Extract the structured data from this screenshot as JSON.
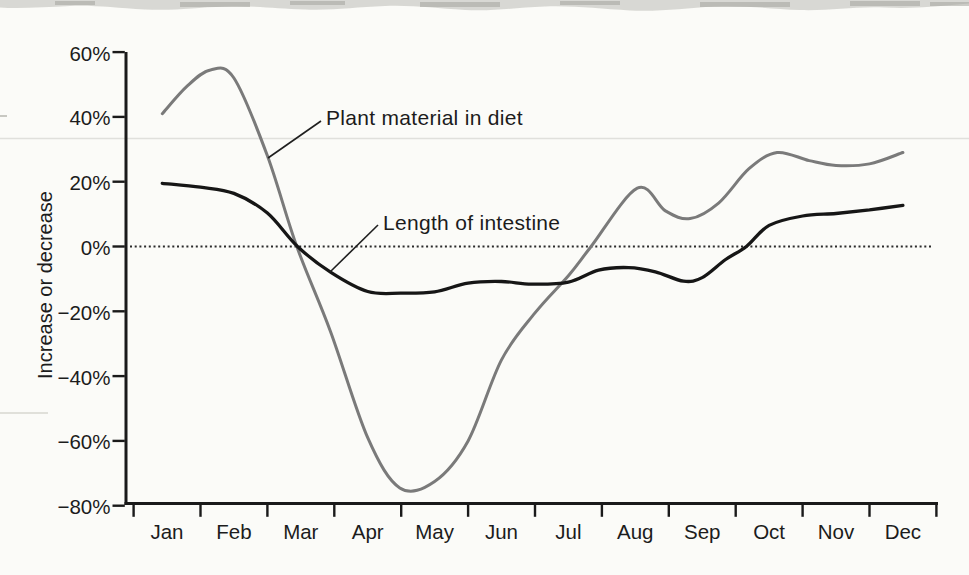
{
  "figure": {
    "paper_color": "#fbfbf8",
    "y_axis_title": "Increase or decrease",
    "annotations": [
      {
        "id": "plant",
        "text": "Plant material in diet"
      },
      {
        "id": "intestine",
        "text": "Length of intestine"
      }
    ]
  },
  "chart_data": {
    "type": "line",
    "title": "",
    "xlabel": "",
    "ylabel": "Increase or decrease",
    "categories": [
      "Jan",
      "Feb",
      "Mar",
      "Apr",
      "May",
      "Jun",
      "Jul",
      "Aug",
      "Sep",
      "Oct",
      "Nov",
      "Dec"
    ],
    "ylim": [
      -80,
      60
    ],
    "ytick_values": [
      60,
      40,
      20,
      0,
      -20,
      -40,
      -60,
      -80
    ],
    "ytick_labels": [
      "60%",
      "40%",
      "20%",
      "0%",
      "−20%",
      "−40%",
      "−60%",
      "−80%"
    ],
    "grid": false,
    "zero_line": "dotted horizontal line at 0%",
    "legend_position": "inline annotations with leader lines",
    "axis_color": "#1a1a1a",
    "series": [
      {
        "id": "plant-material",
        "name": "Plant material in diet",
        "color": "#7a7a7a",
        "line_width": 3,
        "values": [
          41,
          52,
          -2,
          -59,
          -72,
          -35,
          -9,
          18,
          10,
          29,
          25,
          29
        ],
        "max_percent": 54.5,
        "min_percent": -74.5,
        "path_points": [
          [
            -0.07,
            41
          ],
          [
            0.3,
            49.5
          ],
          [
            0.65,
            54.5
          ],
          [
            1,
            52
          ],
          [
            1.5,
            28
          ],
          [
            1.94,
            0
          ],
          [
            2.44,
            -26
          ],
          [
            3,
            -59
          ],
          [
            3.48,
            -74.5
          ],
          [
            4,
            -72.5
          ],
          [
            4.5,
            -60
          ],
          [
            5,
            -35
          ],
          [
            5.5,
            -20.5
          ],
          [
            6,
            -9
          ],
          [
            6.34,
            0
          ],
          [
            7.03,
            18
          ],
          [
            7.45,
            11
          ],
          [
            7.82,
            8.6
          ],
          [
            8.25,
            13.5
          ],
          [
            8.7,
            24
          ],
          [
            9.12,
            29
          ],
          [
            9.6,
            26.5
          ],
          [
            10,
            25
          ],
          [
            10.5,
            25.5
          ],
          [
            11,
            29
          ]
        ]
      },
      {
        "id": "intestine-length",
        "name": "Length of intestine",
        "color": "#161616",
        "line_width": 3.3,
        "values": [
          19,
          16,
          0,
          -14,
          -14,
          -11,
          -11,
          -6,
          -10,
          7,
          10,
          13
        ],
        "max_percent": 19.5,
        "min_percent": -14.5,
        "path_points": [
          [
            -0.07,
            19.5
          ],
          [
            0.5,
            18.3
          ],
          [
            1,
            16.4
          ],
          [
            1.5,
            10.3
          ],
          [
            1.95,
            0
          ],
          [
            2.45,
            -8
          ],
          [
            3,
            -13.9
          ],
          [
            3.5,
            -14.4
          ],
          [
            4,
            -14
          ],
          [
            4.5,
            -11.3
          ],
          [
            5,
            -10.8
          ],
          [
            5.45,
            -11.6
          ],
          [
            6,
            -11
          ],
          [
            6.45,
            -7.3
          ],
          [
            6.9,
            -6.5
          ],
          [
            7.3,
            -7.8
          ],
          [
            7.72,
            -10.7
          ],
          [
            8,
            -9.6
          ],
          [
            8.35,
            -4
          ],
          [
            8.66,
            0
          ],
          [
            9,
            6.5
          ],
          [
            9.5,
            9.4
          ],
          [
            10,
            10.2
          ],
          [
            10.5,
            11.3
          ],
          [
            11,
            12.7
          ]
        ]
      }
    ]
  }
}
